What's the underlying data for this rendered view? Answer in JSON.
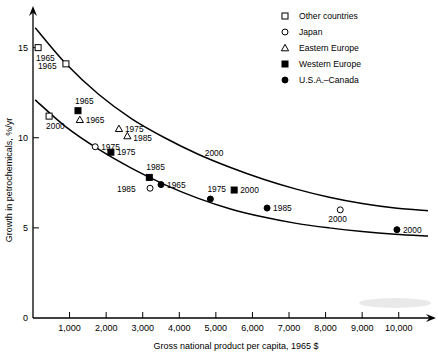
{
  "chart_data": {
    "type": "scatter",
    "title": "",
    "xlabel": "Gross national product per capita, 1965 $",
    "ylabel": "Growth in petrochemicals, %/yr",
    "xlim": [
      0,
      10800
    ],
    "ylim": [
      0,
      16.2
    ],
    "xticks": [
      0,
      1000,
      2000,
      3000,
      4000,
      5000,
      6000,
      7000,
      8000,
      9000,
      10000
    ],
    "xtick_labels": [
      "",
      "1,000",
      "2,000",
      "3,000",
      "4,000",
      "5,000",
      "6,000",
      "7,000",
      "8,000",
      "9,000",
      "10,000"
    ],
    "yticks": [
      0,
      5,
      10,
      15
    ],
    "ytick_labels": [
      "0",
      "5",
      "10",
      "15"
    ],
    "grid": false,
    "legend_position": "top-right",
    "series": [
      {
        "name": "Other countries",
        "marker": "open-square",
        "points": [
          {
            "label": "1965",
            "x": 140,
            "y": 15.0,
            "label_dx": -2,
            "label_dy": 13
          },
          {
            "label": "1965",
            "x": 900,
            "y": 14.1,
            "label_dx": -28,
            "label_dy": 5
          },
          {
            "label": "2000",
            "x": 440,
            "y": 11.2,
            "label_dx": -3,
            "label_dy": 13
          }
        ]
      },
      {
        "name": "Japan",
        "marker": "open-circle",
        "points": [
          {
            "label": "1975",
            "x": 1700,
            "y": 9.5,
            "label_dx": 6,
            "label_dy": 3
          },
          {
            "label": "1985",
            "x": 3200,
            "y": 7.2,
            "label_dx": -33,
            "label_dy": 4
          },
          {
            "label": "2000",
            "x": 8400,
            "y": 6.0,
            "label_dx": -12,
            "label_dy": 12
          }
        ]
      },
      {
        "name": "Eastern Europe",
        "marker": "open-triangle",
        "points": [
          {
            "label": "1965",
            "x": 1280,
            "y": 11.0,
            "label_dx": 6,
            "label_dy": 3
          },
          {
            "label": "1975",
            "x": 2350,
            "y": 10.5,
            "label_dx": 6,
            "label_dy": 3
          },
          {
            "label": "1985",
            "x": 2580,
            "y": 10.1,
            "label_dx": 6,
            "label_dy": 5
          }
        ]
      },
      {
        "name": "Western Europe",
        "marker": "solid-square",
        "points": [
          {
            "label": "1965",
            "x": 1230,
            "y": 11.5,
            "label_dx": -3,
            "label_dy": -7
          },
          {
            "label": "1975",
            "x": 2130,
            "y": 9.2,
            "label_dx": 6,
            "label_dy": 3
          },
          {
            "label": "1985",
            "x": 3180,
            "y": 7.8,
            "label_dx": -3,
            "label_dy": -7
          },
          {
            "label": "2000",
            "x": 5500,
            "y": 7.1,
            "label_dx": 6,
            "label_dy": 3
          }
        ]
      },
      {
        "name": "U.S.A.–Canada",
        "marker": "solid-circle",
        "points": [
          {
            "label": "1965",
            "x": 3500,
            "y": 7.4,
            "label_dx": 6,
            "label_dy": 3
          },
          {
            "label": "1975",
            "x": 4850,
            "y": 6.6,
            "label_dx": -3,
            "label_dy": -7
          },
          {
            "label": "1985",
            "x": 6400,
            "y": 6.1,
            "label_dx": 6,
            "label_dy": 3
          },
          {
            "label": "2000",
            "x": 9950,
            "y": 4.9,
            "label_dx": 6,
            "label_dy": 3
          }
        ]
      }
    ],
    "annotations": [
      {
        "text": "2000",
        "x": 4950,
        "y": 9.0
      }
    ],
    "envelope_curves": [
      {
        "name": "upper-bound-curve",
        "points": [
          [
            60,
            16.1
          ],
          [
            900,
            14.1
          ],
          [
            1800,
            12.4
          ],
          [
            2700,
            11.05
          ],
          [
            3600,
            10.0
          ],
          [
            4500,
            9.1
          ],
          [
            5400,
            8.35
          ],
          [
            6300,
            7.7
          ],
          [
            7200,
            7.15
          ],
          [
            8100,
            6.7
          ],
          [
            9000,
            6.35
          ],
          [
            9900,
            6.1
          ],
          [
            10800,
            5.95
          ]
        ]
      },
      {
        "name": "lower-bound-curve",
        "points": [
          [
            60,
            12.1
          ],
          [
            900,
            10.6
          ],
          [
            1800,
            9.35
          ],
          [
            2700,
            8.3
          ],
          [
            3600,
            7.4
          ],
          [
            4500,
            6.65
          ],
          [
            5400,
            6.05
          ],
          [
            6300,
            5.6
          ],
          [
            7200,
            5.25
          ],
          [
            8100,
            5.0
          ],
          [
            9000,
            4.8
          ],
          [
            9900,
            4.65
          ],
          [
            10800,
            4.55
          ]
        ]
      }
    ]
  },
  "legend": {
    "entries": [
      {
        "label": "Other countries",
        "marker": "open-square"
      },
      {
        "label": "Japan",
        "marker": "open-circle"
      },
      {
        "label": "Eastern Europe",
        "marker": "open-triangle"
      },
      {
        "label": "Western Europe",
        "marker": "solid-square"
      },
      {
        "label": "U.S.A.–Canada",
        "marker": "solid-circle"
      }
    ]
  }
}
